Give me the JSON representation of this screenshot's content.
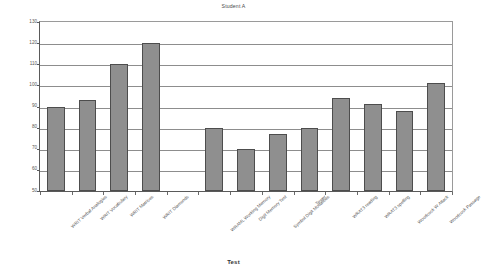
{
  "chart_data": {
    "type": "bar",
    "title": "Student A",
    "xlabel": "Test",
    "ylabel": "",
    "ylim": [
      50,
      130
    ],
    "ytick_step": 10,
    "yticks": [
      50,
      60,
      70,
      80,
      90,
      100,
      110,
      120,
      130
    ],
    "grid": true,
    "legend": false,
    "bar_color": "#8f8f8f",
    "bar_border_color": "#4d4d4d",
    "categories": [
      "WRIT Verbal Analogies",
      "WRIT Vocabulary",
      "WRIT Matrices",
      "WRIT Diamonds",
      "",
      "WRAML Working Memory",
      "Digit Memory Test",
      "Symbol Digit Modalities",
      "Tower",
      "WRAT3 reading",
      "WRAT3 spelling",
      "Woodcock W Attack",
      "Woodcock Passage"
    ],
    "values": [
      90,
      93,
      110,
      120,
      null,
      80,
      70,
      77,
      80,
      94,
      91,
      88,
      101
    ]
  },
  "axis": {
    "y_tick_labels": [
      "130",
      "120",
      "110",
      "100",
      "90",
      "80",
      "70",
      "60",
      "50"
    ],
    "x_title": "Test"
  }
}
